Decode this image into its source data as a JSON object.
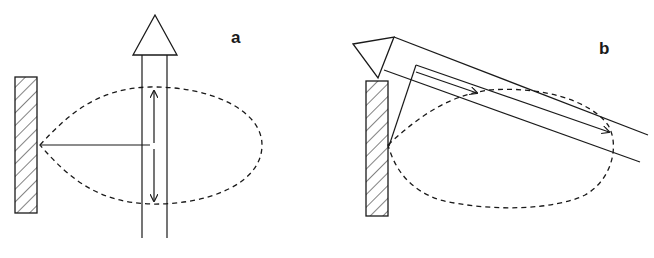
{
  "figure": {
    "panels": [
      {
        "id": "a",
        "label": "a",
        "description": "Antenna element beside reflector with elliptical dashed radiation lobe; vertical double-walled beam with upward arrowhead and double-headed vertical arrow"
      },
      {
        "id": "b",
        "label": "b",
        "description": "Tilted beam with arrowhead toward upper-left above reflector; dashed lobe below; inner arrows pointing down-right"
      }
    ],
    "colors": {
      "stroke": "#1a1a1a",
      "background": "#ffffff"
    }
  }
}
